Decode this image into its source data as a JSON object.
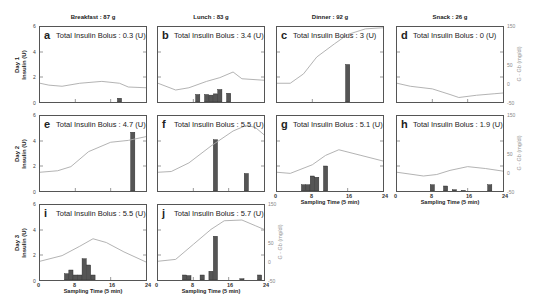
{
  "figure": {
    "meals": [
      {
        "label": "Breakfast : 87 g"
      },
      {
        "label": "Lunch : 83 g"
      },
      {
        "label": "Dinner : 92 g"
      },
      {
        "label": "Snack : 26 g"
      }
    ],
    "days": [
      {
        "label_day": "Day 1",
        "label_axis": "Insulin (U)"
      },
      {
        "label_day": "Day 2",
        "label_axis": "Insulin (U)"
      },
      {
        "label_day": "Day 3",
        "label_axis": "Insulin (U)"
      }
    ],
    "left_ticks": [
      "0",
      "2",
      "4",
      "6"
    ],
    "right_ticks": [
      "-50",
      "0",
      "50",
      "150"
    ],
    "right_axis_label": "G - Gb (mg/dl)",
    "x_ticks": [
      "0",
      "8",
      "16",
      "24"
    ],
    "x_axis_label": "Sampling Time (5 min)",
    "colors": {
      "bar": "#555555",
      "line": "#aaaaaa",
      "frame": "#555555"
    }
  },
  "panels": [
    {
      "letter": "a",
      "bolus_text": "Total Insulin Bolus : 0.3 (U)"
    },
    {
      "letter": "b",
      "bolus_text": "Total Insulin Bolus : 3.4 (U)"
    },
    {
      "letter": "c",
      "bolus_text": "Total Insulin Bolus : 3 (U)"
    },
    {
      "letter": "d",
      "bolus_text": "Total Insulin Bolus : 0 (U)"
    },
    {
      "letter": "e",
      "bolus_text": "Total Insulin Bolus : 4.7 (U)"
    },
    {
      "letter": "f",
      "bolus_text": "Total Insulin Bolus : 5.5 (U)"
    },
    {
      "letter": "g",
      "bolus_text": "Total Insulin Bolus : 5.1 (U)"
    },
    {
      "letter": "h",
      "bolus_text": "Total Insulin Bolus : 1.9 (U)"
    },
    {
      "letter": "i",
      "bolus_text": "Total Insulin Bolus : 5.5 (U)"
    },
    {
      "letter": "j",
      "bolus_text": "Total Insulin Bolus : 5.7 (U)"
    }
  ],
  "chart_data": {
    "type": "bar",
    "xlabel": "Sampling Time (5 min)",
    "ylabel": "Insulin (U)",
    "y2label": "G - Gb (mg/dl)",
    "xlim": [
      0,
      24
    ],
    "ylim": [
      0,
      6
    ],
    "y2lim": [
      -50,
      150
    ],
    "x_ticks": [
      0,
      8,
      16,
      24
    ],
    "grid": false,
    "panels": [
      {
        "id": "a",
        "day": 1,
        "meal": "Breakfast",
        "carbs_g": 87,
        "total_bolus_U": 0.3,
        "insulin_bars": [
          {
            "t": 18,
            "u": 0.3
          }
        ],
        "glucose_dev": [
          [
            0,
            0
          ],
          [
            2,
            -5
          ],
          [
            5,
            -8
          ],
          [
            9,
            0
          ],
          [
            14,
            5
          ],
          [
            18,
            0
          ],
          [
            20,
            -10
          ],
          [
            24,
            -12
          ]
        ]
      },
      {
        "id": "b",
        "day": 1,
        "meal": "Lunch",
        "carbs_g": 83,
        "total_bolus_U": 3.4,
        "insulin_bars": [
          {
            "t": 9,
            "u": 0.6
          },
          {
            "t": 11,
            "u": 0.6
          },
          {
            "t": 12,
            "u": 0.55
          },
          {
            "t": 13,
            "u": 0.65
          },
          {
            "t": 14,
            "u": 1.0
          },
          {
            "t": 16,
            "u": 0.7
          }
        ],
        "glucose_dev": [
          [
            0,
            0
          ],
          [
            4,
            -18
          ],
          [
            7,
            -12
          ],
          [
            11,
            5
          ],
          [
            14,
            15
          ],
          [
            17,
            30
          ],
          [
            19,
            12
          ],
          [
            24,
            8
          ]
        ]
      },
      {
        "id": "c",
        "day": 1,
        "meal": "Dinner",
        "carbs_g": 92,
        "total_bolus_U": 3.0,
        "insulin_bars": [
          {
            "t": 16,
            "u": 3.0
          }
        ],
        "glucose_dev": [
          [
            0,
            0
          ],
          [
            3,
            0
          ],
          [
            6,
            25
          ],
          [
            9,
            70
          ],
          [
            13,
            105
          ],
          [
            16,
            130
          ],
          [
            20,
            145
          ],
          [
            24,
            148
          ]
        ]
      },
      {
        "id": "d",
        "day": 1,
        "meal": "Snack",
        "carbs_g": 26,
        "total_bolus_U": 0,
        "insulin_bars": [],
        "glucose_dev": [
          [
            0,
            0
          ],
          [
            3,
            -8
          ],
          [
            8,
            -15
          ],
          [
            12,
            -30
          ],
          [
            14,
            -38
          ],
          [
            18,
            -32
          ],
          [
            22,
            -28
          ],
          [
            24,
            -26
          ]
        ]
      },
      {
        "id": "e",
        "day": 2,
        "meal": "Breakfast",
        "carbs_g": 87,
        "total_bolus_U": 4.7,
        "insulin_bars": [
          {
            "t": 21,
            "u": 4.7
          }
        ],
        "glucose_dev": [
          [
            0,
            0
          ],
          [
            4,
            4
          ],
          [
            7,
            15
          ],
          [
            11,
            55
          ],
          [
            16,
            80
          ],
          [
            20,
            85
          ],
          [
            24,
            95
          ]
        ]
      },
      {
        "id": "f",
        "day": 2,
        "meal": "Lunch",
        "carbs_g": 83,
        "total_bolus_U": 5.5,
        "insulin_bars": [
          {
            "t": 13,
            "u": 4.1
          },
          {
            "t": 20,
            "u": 1.4
          }
        ],
        "glucose_dev": [
          [
            0,
            0
          ],
          [
            3,
            2
          ],
          [
            7,
            25
          ],
          [
            12,
            70
          ],
          [
            17,
            110
          ],
          [
            20,
            125
          ],
          [
            22,
            120
          ],
          [
            24,
            100
          ]
        ]
      },
      {
        "id": "g",
        "day": 2,
        "meal": "Dinner",
        "carbs_g": 92,
        "total_bolus_U": 5.1,
        "insulin_bars": [
          {
            "t": 6,
            "u": 0.5
          },
          {
            "t": 7,
            "u": 0.5
          },
          {
            "t": 8,
            "u": 1.2
          },
          {
            "t": 9,
            "u": 1.1
          },
          {
            "t": 11,
            "u": 2.0
          }
        ],
        "glucose_dev": [
          [
            0,
            0
          ],
          [
            3,
            -3
          ],
          [
            8,
            20
          ],
          [
            11,
            45
          ],
          [
            14,
            60
          ],
          [
            19,
            45
          ],
          [
            24,
            30
          ]
        ]
      },
      {
        "id": "h",
        "day": 2,
        "meal": "Snack",
        "carbs_g": 26,
        "total_bolus_U": 1.9,
        "insulin_bars": [
          {
            "t": 8,
            "u": 0.5
          },
          {
            "t": 11,
            "u": 0.4
          },
          {
            "t": 13,
            "u": 0.1
          },
          {
            "t": 15,
            "u": 0.05
          },
          {
            "t": 21,
            "u": 0.5
          }
        ],
        "glucose_dev": [
          [
            0,
            0
          ],
          [
            6,
            -10
          ],
          [
            9,
            -6
          ],
          [
            12,
            5
          ],
          [
            16,
            15
          ],
          [
            20,
            10
          ],
          [
            24,
            3
          ]
        ]
      },
      {
        "id": "i",
        "day": 3,
        "meal": "Breakfast",
        "carbs_g": 87,
        "total_bolus_U": 5.5,
        "insulin_bars": [
          {
            "t": 6,
            "u": 0.5
          },
          {
            "t": 7,
            "u": 0.8
          },
          {
            "t": 8,
            "u": 0.4
          },
          {
            "t": 9,
            "u": 0.4
          },
          {
            "t": 10,
            "u": 1.7
          },
          {
            "t": 11,
            "u": 1.2
          },
          {
            "t": 12,
            "u": 0.4
          }
        ],
        "glucose_dev": [
          [
            0,
            0
          ],
          [
            5,
            15
          ],
          [
            9,
            40
          ],
          [
            12,
            60
          ],
          [
            15,
            50
          ],
          [
            19,
            25
          ],
          [
            24,
            -2
          ]
        ]
      },
      {
        "id": "j",
        "day": 3,
        "meal": "Lunch",
        "carbs_g": 83,
        "total_bolus_U": 5.7,
        "insulin_bars": [
          {
            "t": 6,
            "u": 0.4
          },
          {
            "t": 7,
            "u": 0.35
          },
          {
            "t": 10,
            "u": 0.4
          },
          {
            "t": 12,
            "u": 0.7
          },
          {
            "t": 13,
            "u": 3.5
          },
          {
            "t": 19,
            "u": 0.1
          },
          {
            "t": 23,
            "u": 0.4
          }
        ],
        "glucose_dev": [
          [
            0,
            0
          ],
          [
            4,
            5
          ],
          [
            8,
            45
          ],
          [
            12,
            85
          ],
          [
            15,
            108
          ],
          [
            19,
            110
          ],
          [
            22,
            95
          ],
          [
            24,
            85
          ]
        ]
      }
    ]
  }
}
